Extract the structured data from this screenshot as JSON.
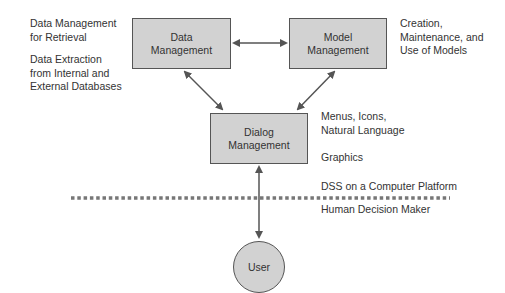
{
  "boxes": {
    "data": {
      "line1": "Data",
      "line2": "Management"
    },
    "model": {
      "line1": "Model",
      "line2": "Management"
    },
    "dialog": {
      "line1": "Dialog",
      "line2": "Management"
    }
  },
  "user": {
    "label": "User"
  },
  "notes": {
    "data_retrieval": [
      "Data Management",
      "for Retrieval"
    ],
    "data_extraction": [
      "Data Extraction",
      "from Internal and",
      "External Databases"
    ],
    "model": [
      "Creation,",
      "Maintenance, and",
      "Use of Models"
    ],
    "dialog_menus": [
      "Menus, Icons,",
      "Natural Language"
    ],
    "dialog_graphics": "Graphics",
    "platform": "DSS on a Computer Platform",
    "human": "Human Decision Maker"
  },
  "colors": {
    "box_fill": "#d2d2d2",
    "stroke": "#555555",
    "dotted": "#777777"
  }
}
